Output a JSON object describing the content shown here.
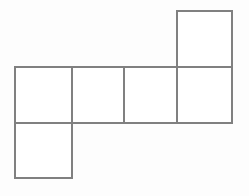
{
  "figure": {
    "name": "cube-net-hexomino",
    "background_color": "#fdfdfd",
    "stroke_color": "#808080",
    "fill_color": "#ffffff",
    "stroke_width": 1.4,
    "canvas": {
      "width": 249,
      "height": 196
    },
    "square_count": 6,
    "squares": [
      {
        "id": "square-top",
        "label": "",
        "x": 177,
        "y": 11,
        "width": 55,
        "height": 56
      },
      {
        "id": "square-row-1",
        "label": "",
        "x": 15,
        "y": 67,
        "width": 57,
        "height": 56
      },
      {
        "id": "square-row-2",
        "label": "",
        "x": 72,
        "y": 67,
        "width": 52,
        "height": 56
      },
      {
        "id": "square-row-3",
        "label": "",
        "x": 124,
        "y": 67,
        "width": 53,
        "height": 56
      },
      {
        "id": "square-row-4",
        "label": "",
        "x": 177,
        "y": 67,
        "width": 55,
        "height": 56
      },
      {
        "id": "square-bottom-left",
        "label": "",
        "x": 15,
        "y": 123,
        "width": 57,
        "height": 55
      }
    ]
  }
}
